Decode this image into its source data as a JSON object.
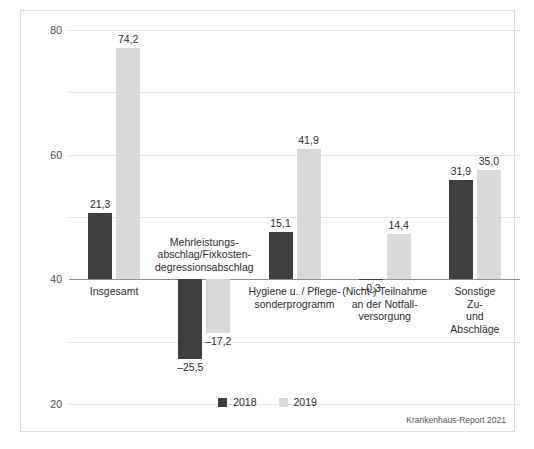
{
  "chart_data": {
    "type": "bar",
    "title": "",
    "subtitle": "",
    "xlabel": "",
    "ylabel": "",
    "ylim": [
      -40,
      80
    ],
    "yticks": [
      80,
      60,
      40,
      20,
      0,
      -20,
      -40
    ],
    "ytick_labels": [
      "80",
      "60",
      "40",
      "20",
      "0",
      "–20",
      "–40"
    ],
    "grid": true,
    "legend_position": "bottom-center",
    "categories": [
      "Insgesamt",
      "Mehrleistungs-\nabschlag/Fixkosten-\ndegressionsabschlag",
      "Hygiene u. / Pflege-\nsonderprogramm",
      "(Nicht-) Teilnahme\nan der Notfall-\nversorgung",
      "Sonstige Zu-\nund Abschläge"
    ],
    "series": [
      {
        "name": "2018",
        "color": "#3f3f3f",
        "values": [
          21.3,
          -25.5,
          15.1,
          -0.3,
          31.9
        ],
        "labels": [
          "21,3",
          "–25,5",
          "15,1",
          "–0,3",
          "31,9"
        ]
      },
      {
        "name": "2019",
        "color": "#d9d9d9",
        "values": [
          74.2,
          -17.2,
          41.9,
          14.4,
          35.0
        ],
        "labels": [
          "74,2",
          "–17,2",
          "41,9",
          "14,4",
          "35,0"
        ]
      }
    ],
    "source_note": "Krankenhaus-Report 2021"
  }
}
